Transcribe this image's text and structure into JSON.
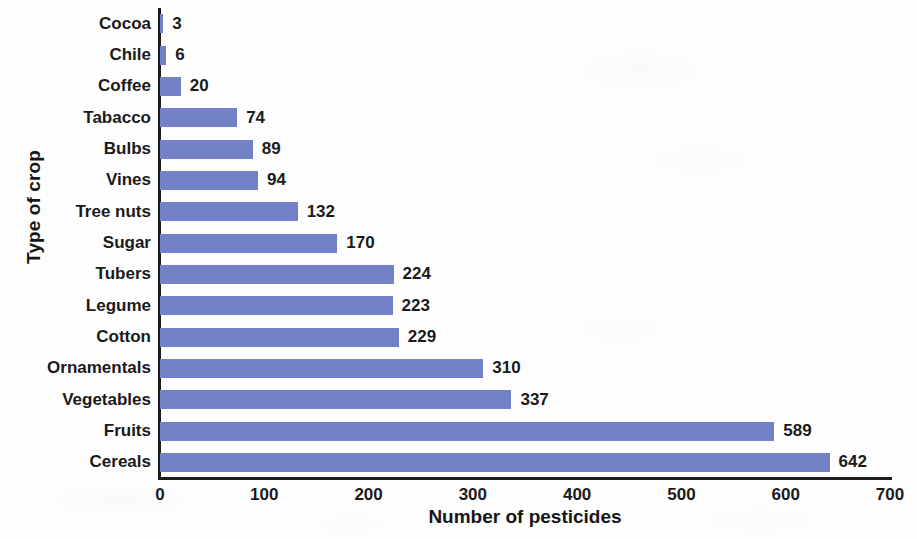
{
  "chart_data": {
    "type": "bar",
    "orientation": "horizontal",
    "title": "",
    "xlabel": "Number of pesticides",
    "ylabel": "Type of crop",
    "categories": [
      "Cocoa",
      "Chile",
      "Coffee",
      "Tabacco",
      "Bulbs",
      "Vines",
      "Tree nuts",
      "Sugar",
      "Tubers",
      "Legume",
      "Cotton",
      "Ornamentals",
      "Vegetables",
      "Fruits",
      "Cereals"
    ],
    "values": [
      3,
      6,
      20,
      74,
      89,
      94,
      132,
      170,
      224,
      223,
      229,
      310,
      337,
      589,
      642
    ],
    "value_labels": [
      "3",
      "6",
      "20",
      "74",
      "89",
      "94",
      "132",
      "170",
      "224",
      "223",
      "229",
      "310",
      "337",
      "589",
      "642"
    ],
    "xlim": [
      0,
      700
    ],
    "xticks": [
      0,
      100,
      200,
      300,
      400,
      500,
      600,
      700
    ],
    "xtick_labels": [
      "0",
      "100",
      "200",
      "300",
      "400",
      "500",
      "600",
      "700"
    ],
    "grid": false,
    "legend": false,
    "bar_color": "#7382c6",
    "axis_color": "#1d1d1d",
    "text_color": "#1a1a1a",
    "background_color": "#fefefe"
  }
}
